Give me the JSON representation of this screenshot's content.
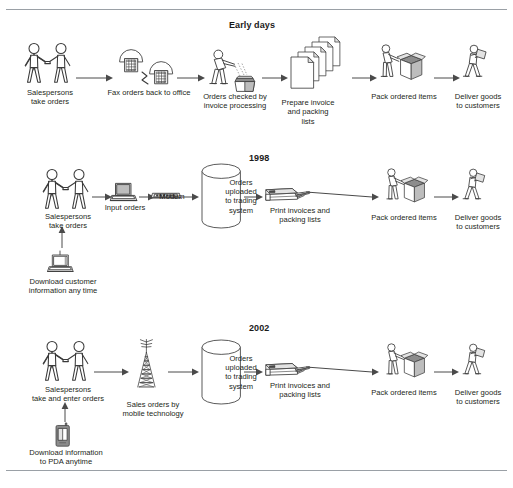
{
  "document": {
    "type": "process-flow-diagram",
    "description": "Three-stage order processing workflow evolution diagram",
    "rows": [
      {
        "id": "early-days",
        "title": "Early days",
        "steps": [
          {
            "id": "salespersons",
            "icon": "two-people-handshake-icon",
            "caption": "Salespersons\ntake orders"
          },
          {
            "id": "fax",
            "icon": "fax-machines-icon",
            "caption": "Fax orders back to office"
          },
          {
            "id": "orders-checked",
            "icon": "person-checking-tray-icon",
            "caption": "Orders checked by\ninvoice processing"
          },
          {
            "id": "prepare-invoice",
            "icon": "document-stack-icon",
            "caption": "Prepare invoice\nand packing\nlists"
          },
          {
            "id": "pack-items",
            "icon": "person-packing-box-icon",
            "caption": "Pack ordered items"
          },
          {
            "id": "deliver-goods",
            "icon": "person-carrying-parcel-icon",
            "caption": "Deliver goods\nto customers"
          }
        ]
      },
      {
        "id": "1998",
        "title": "1998",
        "steps": [
          {
            "id": "salespersons",
            "icon": "two-people-handshake-icon",
            "caption": "Salespersons\ntake orders"
          },
          {
            "id": "input-orders",
            "icon": "laptop-icon",
            "caption": "Input orders"
          },
          {
            "id": "modem",
            "icon": "modem-icon",
            "caption": "Modem"
          },
          {
            "id": "trading-system",
            "icon": "database-cylinder-icon",
            "caption": "Orders\nuploaded\nto trading\nsystem"
          },
          {
            "id": "print-invoices",
            "icon": "printer-icon",
            "caption": "Print invoices and\npacking lists"
          },
          {
            "id": "pack-items",
            "icon": "person-packing-box-icon",
            "caption": "Pack ordered items"
          },
          {
            "id": "deliver-goods",
            "icon": "person-carrying-parcel-icon",
            "caption": "Deliver goods\nto customers"
          }
        ],
        "branch": {
          "id": "download-customer",
          "icon": "laptop-icon",
          "caption": "Download customer\ninformation any time"
        }
      },
      {
        "id": "2002",
        "title": "2002",
        "steps": [
          {
            "id": "salespersons",
            "icon": "two-people-handshake-icon",
            "caption": "Salespersons\ntake and enter orders"
          },
          {
            "id": "mobile-tower",
            "icon": "antenna-tower-icon",
            "caption": "Sales orders by\nmobile technology"
          },
          {
            "id": "trading-system",
            "icon": "database-cylinder-icon",
            "caption": "Orders\nuploaded\nto trading\nsystem"
          },
          {
            "id": "print-invoices",
            "icon": "printer-icon",
            "caption": "Print invoices and\npacking lists"
          },
          {
            "id": "pack-items",
            "icon": "person-packing-box-icon",
            "caption": "Pack ordered items"
          },
          {
            "id": "deliver-goods",
            "icon": "person-carrying-parcel-icon",
            "caption": "Deliver goods\nto customers"
          }
        ],
        "branch": {
          "id": "download-pda",
          "icon": "pda-icon",
          "caption": "Download information\nto PDA anytime"
        }
      }
    ],
    "colors": {
      "background": "#ffffff",
      "line": "#3a3a3a",
      "text": "#231f20",
      "rule": "#9aa0a6",
      "shade_light": "#e3e3e3",
      "shade_mid": "#bdbdbd",
      "shade_dark": "#8c8c8c"
    }
  }
}
